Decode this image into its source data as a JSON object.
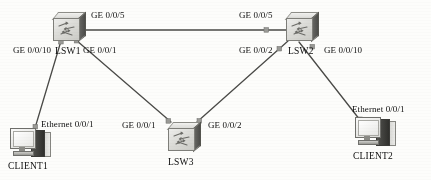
{
  "diagram": {
    "type": "network-topology",
    "title_strip": "",
    "nodes": [
      {
        "id": "lsw1",
        "label": "LSW1",
        "kind": "switch",
        "x": 52,
        "y": 12
      },
      {
        "id": "lsw2",
        "label": "LSW2",
        "kind": "switch",
        "x": 285,
        "y": 12
      },
      {
        "id": "lsw3",
        "label": "LSW3",
        "kind": "switch",
        "x": 167,
        "y": 122
      },
      {
        "id": "client1",
        "label": "CLIENT1",
        "kind": "pc",
        "x": 10,
        "y": 126
      },
      {
        "id": "client2",
        "label": "CLIENT2",
        "kind": "pc",
        "x": 355,
        "y": 115
      }
    ],
    "links": [
      {
        "from": "lsw1",
        "to": "lsw2",
        "from_port": "GE 0/0/5",
        "to_port": "GE 0/0/5"
      },
      {
        "from": "lsw1",
        "to": "lsw3",
        "from_port": "GE 0/0/1",
        "to_port": "GE 0/0/1"
      },
      {
        "from": "lsw2",
        "to": "lsw3",
        "from_port": "GE 0/0/2",
        "to_port": "GE 0/0/2"
      },
      {
        "from": "lsw1",
        "to": "client1",
        "from_port": "GE 0/0/10",
        "to_port": "Ethernet 0/0/1"
      },
      {
        "from": "lsw2",
        "to": "client2",
        "from_port": "GE 0/0/10",
        "to_port": "Ethernet 0/0/1"
      }
    ],
    "port_labels": {
      "lsw1_ge5": "GE 0/0/5",
      "lsw2_ge5": "GE 0/0/5",
      "lsw1_ge10": "GE 0/0/10",
      "lsw1_ge1": "GE 0/0/1",
      "lsw2_ge2": "GE 0/0/2",
      "lsw2_ge10": "GE 0/0/10",
      "lsw3_ge1": "GE 0/0/1",
      "lsw3_ge2": "GE 0/0/2",
      "client1_eth": "Ethernet 0/0/1",
      "client2_eth": "Ethernet 0/0/1"
    },
    "node_labels": {
      "lsw1": "LSW1",
      "lsw2": "LSW2",
      "lsw3": "LSW3",
      "client1": "CLIENT1",
      "client2": "CLIENT2"
    },
    "colors": {
      "background": "#fdfdfb",
      "link": "#4a4a47",
      "text": "#101010",
      "device_light": "#e6e6e2",
      "device_dark": "#4c4c49"
    }
  }
}
